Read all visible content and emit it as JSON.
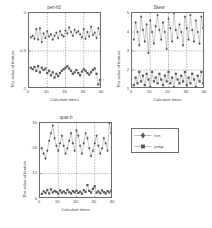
{
  "figure": {
    "background": "#ffffff",
    "axis_color": "#6d6d6d",
    "series_color": "#7b7b7b",
    "grid_color": "#6a6a6a"
  },
  "legend": {
    "items": [
      {
        "label": "run",
        "marker": "diamond-marker"
      },
      {
        "label": "jump",
        "marker": "square-marker"
      }
    ]
  },
  "chart_data": [
    {
      "type": "line",
      "title": "peri-h3",
      "xlabel": "Calculate times",
      "ylabel": "The value of feature",
      "xlim": [
        0,
        40
      ],
      "ylim": [
        -1,
        0
      ],
      "xticks": [
        0,
        10,
        20,
        30,
        40
      ],
      "yticks": [
        0,
        -0.5,
        -1
      ],
      "ytick_labels": [
        "0",
        "-0.5",
        "-1"
      ],
      "grid": "dashed",
      "gridlines_x": [
        10,
        20,
        30
      ],
      "gridlines_y": [
        -0.5
      ],
      "legend_position": "external-right",
      "x": [
        1,
        2,
        3,
        4,
        5,
        6,
        7,
        8,
        9,
        10,
        11,
        12,
        13,
        14,
        15,
        16,
        17,
        18,
        19,
        20,
        21,
        22,
        23,
        24,
        25,
        26,
        27,
        28,
        29,
        30,
        31,
        32,
        33,
        34,
        35,
        36,
        37,
        38,
        39,
        40
      ],
      "series": [
        {
          "name": "run",
          "marker": "diamond-marker",
          "values": [
            -0.32,
            -0.3,
            -0.34,
            -0.21,
            -0.35,
            -0.2,
            -0.38,
            -0.27,
            -0.33,
            -0.24,
            -0.31,
            -0.28,
            -0.35,
            -0.3,
            -0.26,
            -0.33,
            -0.24,
            -0.29,
            -0.31,
            -0.23,
            -0.27,
            -0.19,
            -0.25,
            -0.3,
            -0.22,
            -0.26,
            -0.24,
            -0.28,
            -0.32,
            -0.21,
            -0.34,
            -0.25,
            -0.31,
            -0.18,
            -0.29,
            -0.26,
            -0.33,
            -0.2,
            -0.28,
            -0.35
          ]
        },
        {
          "name": "jump",
          "marker": "square-marker",
          "values": [
            -0.72,
            -0.74,
            -0.71,
            -0.76,
            -0.7,
            -0.78,
            -0.72,
            -0.75,
            -0.73,
            -0.79,
            -0.76,
            -0.82,
            -0.78,
            -0.85,
            -0.8,
            -0.83,
            -0.79,
            -0.76,
            -0.74,
            -0.72,
            -0.7,
            -0.73,
            -0.76,
            -0.8,
            -0.78,
            -0.75,
            -0.79,
            -0.82,
            -0.77,
            -0.74,
            -0.76,
            -0.79,
            -0.81,
            -0.78,
            -0.75,
            -0.73,
            -0.8,
            -0.94,
            -0.88,
            -0.92
          ]
        }
      ]
    },
    {
      "type": "line",
      "title": "Skew",
      "xlabel": "Calculate times",
      "ylabel": "The value of feature",
      "xlim": [
        0,
        40
      ],
      "ylim": [
        1,
        5
      ],
      "xticks": [
        0,
        10,
        20,
        30,
        40
      ],
      "yticks": [
        1,
        2,
        3,
        4,
        5
      ],
      "ytick_labels": [
        "1",
        "2",
        "3",
        "4",
        "5"
      ],
      "grid": "dashed",
      "gridlines_x": [
        10,
        20,
        30
      ],
      "gridlines_y": [
        2,
        3
      ],
      "legend_position": "external-right",
      "x": [
        1,
        2,
        3,
        4,
        5,
        6,
        7,
        8,
        9,
        10,
        11,
        12,
        13,
        14,
        15,
        16,
        17,
        18,
        19,
        20,
        21,
        22,
        23,
        24,
        25,
        26,
        27,
        28,
        29,
        30,
        31,
        32,
        33,
        34,
        35,
        36,
        37,
        38,
        39,
        40
      ],
      "series": [
        {
          "name": "run",
          "marker": "diamond-marker",
          "values": [
            3.6,
            4.5,
            4.0,
            3.3,
            4.8,
            4.1,
            3.5,
            4.4,
            2.9,
            4.6,
            4.0,
            3.4,
            4.3,
            4.9,
            4.1,
            3.6,
            4.5,
            4.0,
            3.1,
            4.7,
            4.2,
            3.5,
            5.0,
            4.1,
            3.7,
            4.4,
            4.0,
            3.3,
            4.8,
            4.2,
            3.6,
            4.9,
            4.1,
            3.5,
            4.6,
            4.0,
            3.4,
            4.8,
            4.2,
            5.0
          ]
        },
        {
          "name": "jump",
          "marker": "square-marker",
          "values": [
            1.2,
            1.6,
            1.3,
            1.9,
            1.4,
            1.7,
            1.2,
            1.8,
            1.5,
            1.1,
            1.9,
            1.4,
            1.6,
            1.3,
            1.8,
            1.5,
            1.2,
            1.7,
            1.4,
            1.9,
            1.3,
            1.6,
            1.1,
            1.8,
            1.5,
            1.3,
            1.7,
            1.4,
            1.9,
            1.2,
            1.6,
            1.3,
            1.8,
            1.5,
            1.1,
            1.7,
            1.4,
            1.9,
            1.3,
            1.8
          ]
        }
      ]
    },
    {
      "type": "line",
      "title": "quar-h",
      "xlabel": "Calculate times",
      "ylabel": "The value of feature",
      "xlim": [
        0,
        40
      ],
      "ylim": [
        0,
        30
      ],
      "xticks": [
        0,
        10,
        20,
        30,
        40
      ],
      "yticks": [
        0,
        10,
        20,
        30
      ],
      "ytick_labels": [
        "0",
        "10",
        "20",
        "30"
      ],
      "grid": "dashed",
      "gridlines_x": [
        10,
        20,
        30
      ],
      "gridlines_y": [
        10
      ],
      "legend_position": "external-right",
      "x": [
        1,
        2,
        3,
        4,
        5,
        6,
        7,
        8,
        9,
        10,
        11,
        12,
        13,
        14,
        15,
        16,
        17,
        18,
        19,
        20,
        21,
        22,
        23,
        24,
        25,
        26,
        27,
        28,
        29,
        30,
        31,
        32,
        33,
        34,
        35,
        36,
        37,
        38,
        39,
        40
      ],
      "series": [
        {
          "name": "run",
          "marker": "diamond-marker",
          "values": [
            20,
            18,
            16,
            19,
            23,
            26,
            29,
            24,
            21,
            19,
            22,
            25,
            21,
            18,
            20,
            23,
            26,
            22,
            19,
            27,
            25,
            21,
            18,
            22,
            26,
            24,
            20,
            17,
            19,
            22,
            25,
            21,
            18,
            20,
            24,
            22,
            19,
            30,
            26,
            23
          ]
        },
        {
          "name": "jump",
          "marker": "square-marker",
          "values": [
            2.0,
            3.0,
            2.4,
            3.5,
            2.2,
            3.8,
            2.6,
            3.2,
            2.8,
            2.1,
            3.4,
            2.5,
            3.0,
            2.3,
            3.6,
            2.7,
            2.2,
            3.1,
            2.6,
            3.3,
            2.4,
            2.9,
            2.1,
            3.5,
            2.8,
            5.5,
            3.2,
            2.6,
            4.0,
            5.0,
            2.5,
            3.0,
            2.3,
            3.4,
            2.7,
            2.2,
            3.1,
            2.6,
            3.3,
            2.4
          ]
        }
      ]
    }
  ]
}
